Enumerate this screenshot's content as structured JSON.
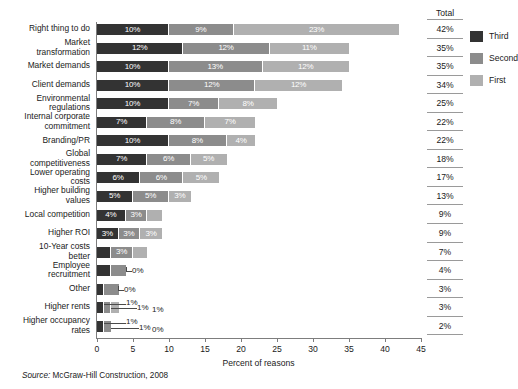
{
  "chart_data": {
    "type": "bar",
    "orientation": "horizontal",
    "stacked": true,
    "title": "",
    "xlabel": "Percent of reasons",
    "ylabel": "",
    "xlim": [
      0,
      45
    ],
    "xticks": [
      0,
      5,
      10,
      15,
      20,
      25,
      30,
      35,
      40,
      45
    ],
    "grid": false,
    "legend_position": "right",
    "categories": [
      "Right thing to do",
      "Market transformation",
      "Market demands",
      "Client demands",
      "Environmental regulations",
      "Internal corporate commitment",
      "Branding/PR",
      "Global competitiveness",
      "Lower operating costs",
      "Higher building values",
      "Local competition",
      "Higher ROI",
      "10-Year costs better",
      "Employee recruitment",
      "Other",
      "Higher rents",
      "Higher occupancy rates"
    ],
    "series": [
      {
        "name": "Third",
        "color": "#333333",
        "values": [
          10,
          12,
          10,
          10,
          10,
          7,
          10,
          7,
          6,
          5,
          4,
          3,
          2,
          2,
          1,
          1,
          1
        ]
      },
      {
        "name": "Second",
        "color": "#8c8c8c",
        "values": [
          9,
          12,
          13,
          12,
          7,
          8,
          8,
          6,
          6,
          5,
          3,
          3,
          3,
          2,
          2,
          1,
          1
        ]
      },
      {
        "name": "First",
        "color": "#b0b0b0",
        "values": [
          23,
          11,
          12,
          12,
          8,
          7,
          4,
          5,
          5,
          3,
          2,
          3,
          2,
          0,
          0,
          1,
          0
        ]
      }
    ],
    "labels": [
      [
        "10%",
        "9%",
        "23%"
      ],
      [
        "12%",
        "12%",
        "11%"
      ],
      [
        "10%",
        "13%",
        "12%"
      ],
      [
        "10%",
        "12%",
        "12%"
      ],
      [
        "10%",
        "7%",
        "8%"
      ],
      [
        "7%",
        "8%",
        "7%"
      ],
      [
        "10%",
        "8%",
        "4%"
      ],
      [
        "7%",
        "6%",
        "5%"
      ],
      [
        "6%",
        "6%",
        "5%"
      ],
      [
        "5%",
        "5%",
        "3%"
      ],
      [
        "4%",
        "3%",
        "2%"
      ],
      [
        "3%",
        "3%",
        "3%"
      ],
      [
        "2%",
        "3%",
        "2%"
      ],
      [
        "2%",
        "2%",
        "0%"
      ],
      [
        "1%",
        "2%",
        "0%"
      ],
      [
        "1%",
        "1%",
        "1%"
      ],
      [
        "1%",
        "1%",
        "0%"
      ]
    ],
    "totals_header": "Total",
    "totals": [
      "42%",
      "35%",
      "35%",
      "34%",
      "25%",
      "22%",
      "22%",
      "18%",
      "17%",
      "13%",
      "9%",
      "9%",
      "7%",
      "4%",
      "3%",
      "3%",
      "2%"
    ],
    "source": "Source: McGraw-Hill Construction, 2008",
    "source_prefix": "Source:",
    "source_body": "McGraw-Hill Construction, 2008"
  },
  "legend": {
    "items": [
      {
        "label": "Third",
        "color": "#333333"
      },
      {
        "label": "Second",
        "color": "#8c8c8c"
      },
      {
        "label": "First",
        "color": "#b0b0b0"
      }
    ]
  }
}
